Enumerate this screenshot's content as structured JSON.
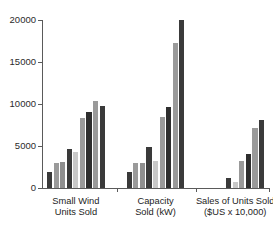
{
  "header": {
    "watermark_text": ""
  },
  "chart_data": {
    "type": "bar",
    "title": "",
    "subtitle": "",
    "xlabel": "",
    "ylabel": "",
    "ylim": [
      0,
      20000
    ],
    "yticks": [
      0,
      5000,
      10000,
      15000,
      20000
    ],
    "ytick_labels": [
      "0",
      "5000",
      "10000",
      "15000",
      "20000"
    ],
    "grid": false,
    "legend_position": "none",
    "categories": [
      "Small Wind Units Sold",
      "Capacity Sold (kW)",
      "Sales of Units Sold ($US x 10,000)"
    ],
    "category_labels": [
      [
        "Small Wind",
        "Units Sold"
      ],
      [
        "Capacity",
        "Sold (kW)"
      ],
      [
        "Sales of Units Sold",
        "($US x 10,000)"
      ]
    ],
    "series": [
      {
        "name": "1",
        "color": "#3a3a3a",
        "values": [
          1900,
          1900,
          0
        ]
      },
      {
        "name": "2",
        "color": "#9a9a9a",
        "values": [
          3000,
          3000,
          0
        ]
      },
      {
        "name": "3",
        "color": "#8f8f8f",
        "values": [
          3050,
          2980,
          0
        ]
      },
      {
        "name": "4",
        "color": "#3a3a3a",
        "values": [
          4700,
          4850,
          1250
        ]
      },
      {
        "name": "5",
        "color": "#c8c8c8",
        "values": [
          4250,
          3200,
          700
        ]
      },
      {
        "name": "6",
        "color": "#9a9a9a",
        "values": [
          8300,
          8400,
          3200
        ]
      },
      {
        "name": "7",
        "color": "#2e2e2e",
        "values": [
          9100,
          9700,
          4100
        ]
      },
      {
        "name": "8",
        "color": "#9a9a9a",
        "values": [
          10300,
          17250,
          7200
        ]
      },
      {
        "name": "9",
        "color": "#3a3a3a",
        "values": [
          9750,
          19950,
          8150
        ]
      }
    ],
    "bar_colors": [
      "#3a3a3a",
      "#9a9a9a",
      "#8f8f8f",
      "#3a3a3a",
      "#c8c8c8",
      "#9a9a9a",
      "#2e2e2e",
      "#9a9a9a",
      "#3a3a3a"
    ],
    "axis_color": "#5a5a5a",
    "background_color": "#ffffff"
  }
}
